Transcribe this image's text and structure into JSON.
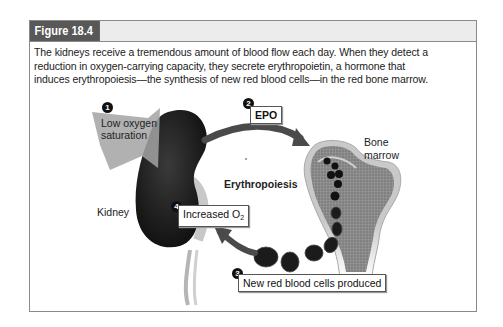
{
  "figure": {
    "label": "Figure 18.4",
    "caption": "The kidneys receive a tremendous amount of blood flow each day. When they detect a reduction in oxygen-carrying capacity, they secrete erythropoietin, a hormone that induces erythropoiesis—the synthesis of new red blood cells—in the red bone marrow."
  },
  "diagram": {
    "steps": [
      {
        "number": "1",
        "label": "Low oxygen saturation"
      },
      {
        "number": "2",
        "label": "EPO"
      },
      {
        "number": "3",
        "label": "New red blood cells produced"
      },
      {
        "number": "4",
        "label": "Increased O",
        "subscript": "2"
      }
    ],
    "labels": {
      "kidney": "Kidney",
      "bone_marrow_line1": "Bone",
      "bone_marrow_line2": "marrow",
      "process": "Erythropoiesis"
    },
    "colors": {
      "kidney": "#1a1a1a",
      "arrow_gray": "#9a9a9a",
      "bone": "#b8b8b8",
      "cells": "#1c1c1c",
      "header_dark": "#585858",
      "header_light": "#ececec"
    }
  }
}
